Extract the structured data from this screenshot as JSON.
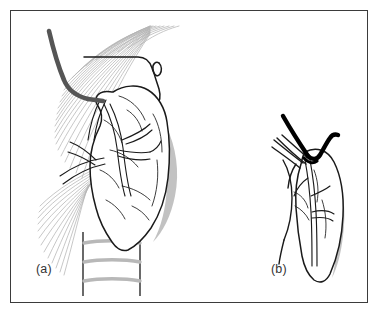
{
  "figure": {
    "kind": "surgical-anatomy-line-drawing",
    "background_color": "#ffffff",
    "frame_color": "#3b3b3b",
    "ink_color": "#1a1a1a",
    "fiber_color": "#b4b4b4",
    "shade_color": "#bfbfbf",
    "cartilage_color": "#b8b8b8",
    "instrument_dark_color": "#555555",
    "instrument_black_color": "#000000",
    "panels": [
      {
        "id": "a",
        "label": "(a)",
        "caption_position": "bottom-left",
        "view": "anterolateral exposure of thyroid lobe with strap muscles retracted",
        "elements": [
          "radiating-muscle-fiber-fan",
          "retractor-instrument",
          "upper-pole-outline",
          "superior-pole-hook",
          "thyroid-lobe",
          "intraglandular-vessels",
          "inferior-thyroid-vessels",
          "lateral-shading-band",
          "trachea",
          "tracheal-cartilage-rings"
        ]
      },
      {
        "id": "b",
        "label": "(b)",
        "caption_position": "bottom-center",
        "view": "close-up of superior pole vascular pedicle with dissector and hook",
        "elements": [
          "dissector-probe",
          "black-hook-instrument",
          "superior-pole-outline",
          "thyroid-lobe",
          "branching-vessels",
          "lateral-shading-band"
        ]
      }
    ]
  },
  "labels": {
    "panel_a": "(a)",
    "panel_b": "(b)"
  }
}
